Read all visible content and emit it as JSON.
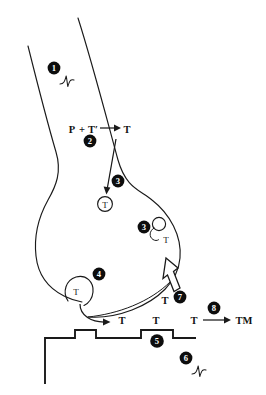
{
  "figure": {
    "background_color": "#ffffff",
    "ink_color": "#1a1a1a",
    "badge_fill": "#0d0d0d",
    "badge_text_color": "#ffffff"
  },
  "steps": [
    {
      "number": "1",
      "name": "action-potential-in-axon",
      "label": "",
      "marker": "squiggle"
    },
    {
      "number": "2",
      "name": "neurotransmitter-synthesis",
      "label": "",
      "marker": "reaction"
    },
    {
      "number": "3",
      "name": "vesicle-packaging",
      "label": "",
      "marker": "vesicle"
    },
    {
      "number": "3",
      "name": "vesicle-recycling",
      "label": "",
      "marker": "vesicle"
    },
    {
      "number": "4",
      "name": "exocytosis-release",
      "label": "",
      "marker": "vesicle-fusion"
    },
    {
      "number": "5",
      "name": "receptor-binding",
      "label": "",
      "marker": "receptor"
    },
    {
      "number": "6",
      "name": "postsynaptic-potential",
      "label": "",
      "marker": "squiggle"
    },
    {
      "number": "7",
      "name": "reuptake",
      "label": "",
      "marker": "hollow-arrow"
    },
    {
      "number": "8",
      "name": "enzymatic-degradation",
      "label": "",
      "marker": "reaction"
    }
  ],
  "reaction_synthesis": {
    "precursor": "P",
    "plus": "+",
    "enzyme": "T′",
    "product": "T"
  },
  "reaction_degradation": {
    "substrate": "T",
    "product": "TM"
  },
  "vesicle_labels": {
    "packaged": "T",
    "recycling": "T",
    "fusing": "T",
    "reuptake": "T"
  },
  "cleft_labels": {
    "released": "T",
    "bound": "T",
    "free": "T"
  }
}
